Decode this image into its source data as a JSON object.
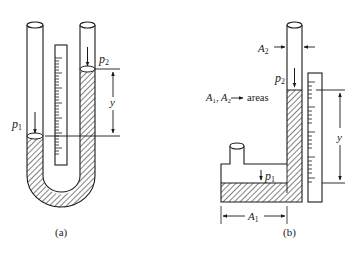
{
  "figure_a": {
    "caption": "(a)",
    "p1": "p",
    "p1_sub": "1",
    "p2": "p",
    "p2_sub": "2",
    "height_label": "y"
  },
  "figure_b": {
    "caption": "(b)",
    "p1": "p",
    "p1_sub": "1",
    "p2": "p",
    "p2_sub": "2",
    "height_label": "y",
    "A1": "A",
    "A1_sub": "1",
    "A2": "A",
    "A2_sub": "2",
    "legend_prefix": "A",
    "legend_sub1": "1",
    "legend_mid": ", A",
    "legend_sub2": "2",
    "legend_suffix": "areas"
  },
  "colors": {
    "stroke": "#1a1a1a",
    "fluid_hatch": "#1a1a1a",
    "background": "#ffffff"
  }
}
